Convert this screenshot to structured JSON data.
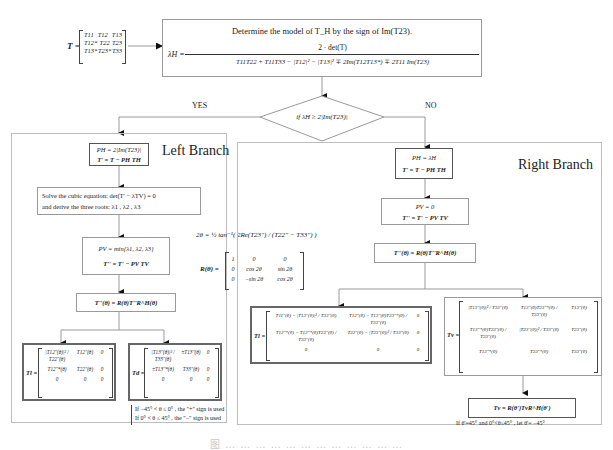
{
  "input_matrix": {
    "label": "T =",
    "rows": [
      [
        "T11",
        "T12",
        "T13"
      ],
      [
        "T12*",
        "T22",
        "T23"
      ],
      [
        "T13*",
        "T23*",
        "T33"
      ]
    ]
  },
  "top_box": {
    "title": "Determine the model of T_H by the sign of Im(T23).",
    "lhs": "λH =",
    "numerator": "2 · det(T)",
    "denominator": "T11T22 + T11T33 − |T12|² − |T13|² ∓ 2Im(T12T13*) ∓ 2T11 Im(T23)"
  },
  "decision": {
    "condition": "if λH ≥ 2|Im(T23)|",
    "yes_label": "YES",
    "no_label": "NO"
  },
  "left_branch": {
    "title": "Left Branch",
    "step1": {
      "line1": "PH = 2|Im(T23)|",
      "line2": "T' = T − PH TH"
    },
    "step2": {
      "line1": "Solve the cubic equation:  det(T' − λTV) = 0",
      "line2": "and derive the three roots:  λ1 , λ2 , λ3"
    },
    "step3": {
      "line1": "PV = min{λ1, λ2, λ3}",
      "line2": "T'' = T' − PV TV"
    },
    "step4": {
      "line1": "T''(θ) = R(θ)T''R^H(θ)"
    },
    "result_tl": {
      "label": "Tl =",
      "rows": [
        [
          "|T12''(θ)|² / T22''(θ)",
          "T12''(θ)",
          "0"
        ],
        [
          "T12''*(θ)",
          "T22''(θ)",
          "0"
        ],
        [
          "0",
          "0",
          "0"
        ]
      ]
    },
    "result_td": {
      "label": "Td =",
      "rows": [
        [
          "|T13''(θ)|² / T33''(θ)",
          "±T13''(θ)",
          "0"
        ],
        [
          "±T13''*(θ)",
          "T33''(θ)",
          "0"
        ],
        [
          "0",
          "0",
          "0"
        ]
      ]
    },
    "sign_note": {
      "line1": "If  −45° < θ ≤ 0° ,   the \"+\" sign is used",
      "line2": "If    0° < θ ≤ 45° ,   the \"−\" sign is used"
    }
  },
  "shared_formulas": {
    "angle": "2θ = ½ tan⁻¹( 2Re(T23'') / (T22'' − T33'') )",
    "rotation_label": "R(θ) =",
    "rotation_rows": [
      [
        "1",
        "0",
        "0"
      ],
      [
        "0",
        "cos 2θ",
        "sin 2θ"
      ],
      [
        "0",
        "−sin 2θ",
        "cos 2θ"
      ]
    ]
  },
  "right_branch": {
    "title": "Right Branch",
    "step1": {
      "line1": "PH = λH",
      "line2": "T' = T − PH TH"
    },
    "step2": {
      "line1": "PV = 0",
      "line2": "T'' = T' − PV TV"
    },
    "step3": {
      "line1": "T''(θ) = R(θ)T''R^H(θ)"
    },
    "result_tl": {
      "label": "Tl =",
      "rows": [
        [
          "T11''(θ) − |T13''(θ)|² / T33''(θ)",
          "T12''(θ) − T13''(θ)T23''*(θ) / T33''(θ)",
          "0"
        ],
        [
          "T12''*(θ) − T13''*(θ)T23''(θ) / T33''(θ)",
          "T22''(θ) − |T23''(θ)|² / T33''(θ)",
          "0"
        ],
        [
          "0",
          "0",
          "0"
        ]
      ]
    },
    "result_tv": {
      "label": "Tv =",
      "rows": [
        [
          "|T13''(θ)|² / T33''(θ)",
          "T13''(θ)T23''*(θ) / T33''(θ)",
          "T13''(θ)"
        ],
        [
          "T13''*(θ)T23''(θ) / T33''(θ)",
          "|T23''(θ)|² / T33''(θ)",
          "T23''(θ)"
        ],
        [
          "T13''*(θ)",
          "T23''*(θ)",
          "T33''(θ)"
        ]
      ]
    },
    "step4": {
      "line1": "Tv = R(θ')TvR^H(θ')"
    },
    "note": "If  θ'=45°  and 0°<θ≤45° ,   let θ'= −45°"
  },
  "caption": "图 … … … … … … … … … … … …"
}
